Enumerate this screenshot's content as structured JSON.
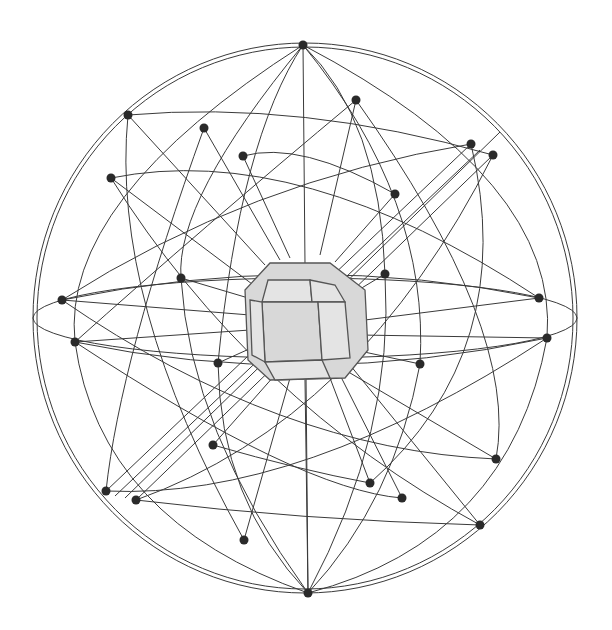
{
  "diagram": {
    "type": "crystal-face-poles-on-sphere",
    "description": "Crystal with octagonal-section faces at center of a sphere; face normals extend outward and intersect the sphere at poles connected by great circles",
    "colors": {
      "background": "#ffffff",
      "lines": "#3a3a3a",
      "crystal_fill": "#d8d8d8",
      "poles": "#2a2a2a"
    },
    "sphere": {
      "cx": 305,
      "cy": 318,
      "rx": 272,
      "ry": 275
    },
    "poles": [
      [
        303,
        45
      ],
      [
        356,
        100
      ],
      [
        128,
        115
      ],
      [
        204,
        128
      ],
      [
        243,
        156
      ],
      [
        471,
        144
      ],
      [
        493,
        155
      ],
      [
        111,
        178
      ],
      [
        395,
        194
      ],
      [
        181,
        278
      ],
      [
        385,
        274
      ],
      [
        62,
        300
      ],
      [
        539,
        298
      ],
      [
        75,
        342
      ],
      [
        547,
        338
      ],
      [
        218,
        363
      ],
      [
        420,
        364
      ],
      [
        213,
        445
      ],
      [
        496,
        459
      ],
      [
        106,
        491
      ],
      [
        136,
        500
      ],
      [
        370,
        483
      ],
      [
        402,
        498
      ],
      [
        480,
        525
      ],
      [
        244,
        540
      ],
      [
        308,
        593
      ]
    ],
    "pole_count": 26
  }
}
